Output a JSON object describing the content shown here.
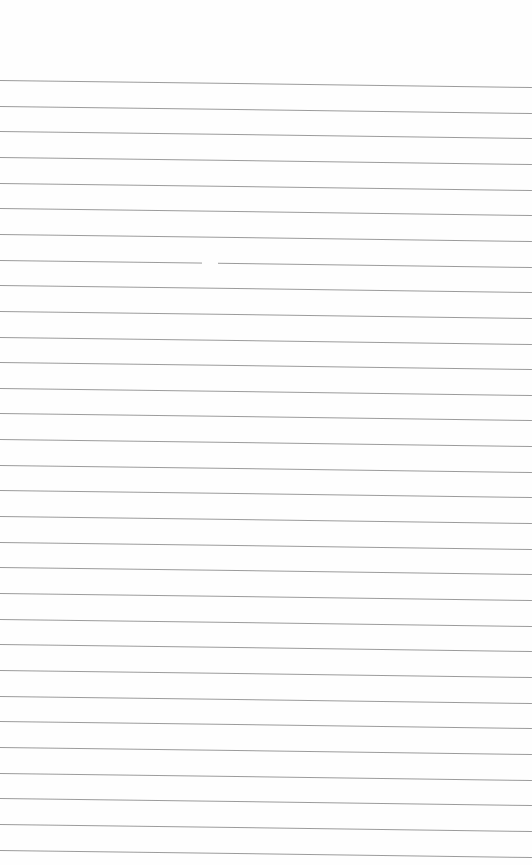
{
  "page": {
    "type": "blank lined paper",
    "line_count": 31,
    "first_line_y": 80,
    "line_spacing": 25.65,
    "line_color": "#8a8a8a",
    "background": "#fefefe",
    "slope_px_over_width": 7,
    "gaps": [
      {
        "line_index": 7,
        "x_start": 202,
        "x_end": 218
      }
    ]
  }
}
